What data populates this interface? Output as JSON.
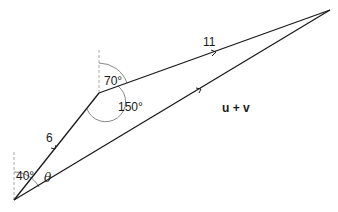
{
  "diagram": {
    "type": "vector-addition",
    "vectors": [
      {
        "name": "u",
        "magnitude_label": "6",
        "from": "origin",
        "to": "vertex"
      },
      {
        "name": "v",
        "magnitude_label": "11",
        "from": "vertex",
        "to": "tip"
      },
      {
        "name": "u + v",
        "label": "u + v",
        "from": "origin",
        "to": "tip"
      }
    ],
    "angles": {
      "origin_bearing": "40°",
      "vertex_bearing": "70°",
      "vertex_interior": "150°",
      "resultant_angle": "θ"
    },
    "colors": {
      "line": "#1a1a1a",
      "arc": "#888888",
      "dashed": "#aaaaaa"
    }
  }
}
